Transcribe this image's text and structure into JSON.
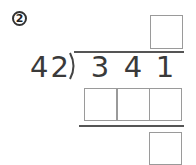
{
  "problem": {
    "number_label": "2",
    "divisor": "42",
    "dividend_digits": [
      "3",
      "4",
      "1"
    ],
    "answer_boxes": {
      "quotient": [
        ""
      ],
      "product": [
        "",
        "",
        ""
      ],
      "remainder": [
        ""
      ]
    }
  },
  "colors": {
    "text": "#3a3a3a",
    "box_border": "#9a9a9a",
    "line": "#555555"
  }
}
